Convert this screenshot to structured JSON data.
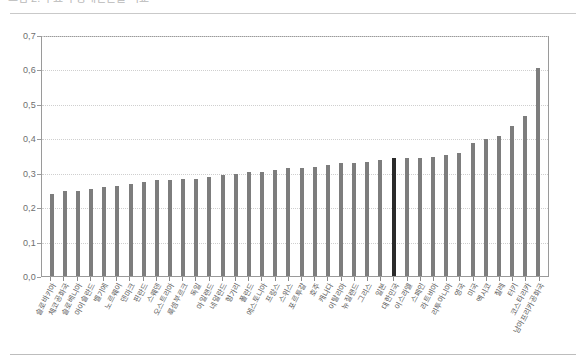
{
  "top_caption": {
    "text": "그림 2. 주요국 상대빈곤율 비교"
  },
  "chart_data": {
    "type": "bar",
    "title": "",
    "subtitle": "",
    "xlabel": "",
    "ylabel": "",
    "ylim": [
      0.0,
      0.7
    ],
    "yticks": [
      "0,0",
      "0,1",
      "0,2",
      "0,3",
      "0,4",
      "0,5",
      "0,6",
      "0,7"
    ],
    "ytick_values": [
      0.0,
      0.1,
      0.2,
      0.3,
      0.4,
      0.5,
      0.6,
      0.7
    ],
    "grid": true,
    "legend": null,
    "highlight_category": "대한민국",
    "colors": {
      "bar": "#7d7d7d",
      "highlight_bar": "#2b2b2b",
      "grid": "#cfcfcf",
      "frame": "#9a9a9a",
      "axis_text": "#6e6e6e"
    },
    "categories": [
      "슬로바키아",
      "체코공화국",
      "슬로베니아",
      "아이슬란드",
      "벨기에",
      "노르웨이",
      "덴마크",
      "핀란드",
      "스웨덴",
      "오스트리아",
      "룩셈부르크",
      "독일",
      "아일랜드",
      "네덜란드",
      "헝가리",
      "폴란드",
      "에스토니아",
      "프랑스",
      "스위스",
      "포르투갈",
      "호주",
      "캐나다",
      "이탈리아",
      "뉴질랜드",
      "그리스",
      "일본",
      "대한민국",
      "이스라엘",
      "스페인",
      "라트비아",
      "리투아니아",
      "영국",
      "미국",
      "멕시코",
      "칠레",
      "터키",
      "코스타리카",
      "남아프리카공화국"
    ],
    "values": [
      0.24,
      0.25,
      0.25,
      0.255,
      0.26,
      0.265,
      0.27,
      0.275,
      0.28,
      0.28,
      0.285,
      0.285,
      0.29,
      0.295,
      0.3,
      0.305,
      0.305,
      0.31,
      0.315,
      0.315,
      0.32,
      0.325,
      0.33,
      0.33,
      0.335,
      0.34,
      0.345,
      0.345,
      0.345,
      0.35,
      0.355,
      0.36,
      0.39,
      0.4,
      0.41,
      0.44,
      0.47,
      0.61
    ]
  }
}
